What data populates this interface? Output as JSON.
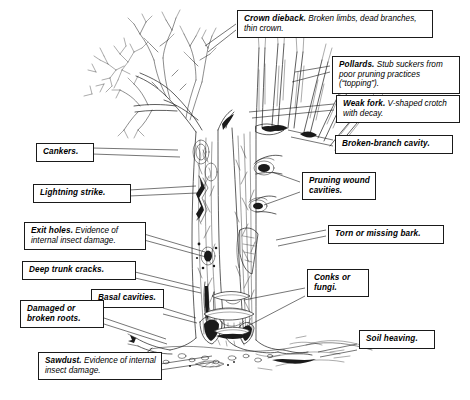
{
  "diagram": {
    "style": "black-and-white pen-and-ink line drawing",
    "background_color": "#ffffff",
    "ink_color": "#1a1a1a"
  },
  "labels": [
    {
      "id": "crown-dieback",
      "heading": "Crown dieback.",
      "body": "Broken limbs, dead branches, thin crown."
    },
    {
      "id": "pollards",
      "heading": "Pollards.",
      "body": "Stub suckers from poor pruning practices (“topping”)."
    },
    {
      "id": "weak-fork",
      "heading": "Weak fork.",
      "body": "V-shaped crotch with decay."
    },
    {
      "id": "broken-branch-cavity",
      "heading": "Broken-branch cavity.",
      "body": ""
    },
    {
      "id": "cankers",
      "heading": "Cankers.",
      "body": ""
    },
    {
      "id": "lightning-strike",
      "heading": "Lightning strike.",
      "body": ""
    },
    {
      "id": "pruning-wound-cavities",
      "heading": "Pruning wound cavities.",
      "body": ""
    },
    {
      "id": "exit-holes",
      "heading": "Exit holes.",
      "body": "Evidence of internal insect damage."
    },
    {
      "id": "torn-or-missing-bark",
      "heading": "Torn or missing bark.",
      "body": ""
    },
    {
      "id": "deep-trunk-cracks",
      "heading": "Deep trunk cracks.",
      "body": ""
    },
    {
      "id": "basal-cavities",
      "heading": "Basal cavities.",
      "body": ""
    },
    {
      "id": "conks-or-fungi",
      "heading": "Conks or fungi.",
      "body": ""
    },
    {
      "id": "damaged-or-broken-roots",
      "heading": "Damaged or broken roots.",
      "body": ""
    },
    {
      "id": "soil-heaving",
      "heading": "Soil heaving.",
      "body": ""
    },
    {
      "id": "sawdust",
      "heading": "Sawdust.",
      "body": "Evidence of internal insect damage."
    }
  ]
}
